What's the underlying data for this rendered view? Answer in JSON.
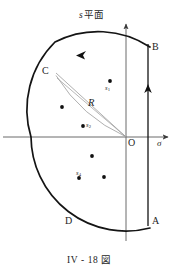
{
  "figure": {
    "caption": "IV - 18 図",
    "plane_label_symbol": "s",
    "plane_label_text": "平面",
    "axis_real_label": "σ",
    "origin_label": "O",
    "radius_label": "R",
    "contour_points": [
      {
        "name": "B",
        "label": "B",
        "x": 150,
        "y": 47
      },
      {
        "name": "C",
        "label": "C",
        "x": 48,
        "y": 72
      },
      {
        "name": "D",
        "label": "D",
        "x": 68,
        "y": 222
      },
      {
        "name": "A",
        "label": "A",
        "x": 150,
        "y": 222
      }
    ],
    "poles": [
      {
        "name": "pole-s1",
        "label": "s",
        "sub": "1",
        "x": 110,
        "y": 81,
        "label_dx": -5,
        "label_dy": 5
      },
      {
        "name": "pole-unlabeled-upper-left",
        "label": "",
        "sub": "",
        "x": 62,
        "y": 107
      },
      {
        "name": "pole-s2",
        "label": "s",
        "sub": "2",
        "x": 83,
        "y": 126,
        "label_dx": 3,
        "label_dy": -1
      },
      {
        "name": "pole-unlabeled-lower-mid",
        "label": "",
        "sub": "",
        "x": 92,
        "y": 156
      },
      {
        "name": "pole-s4",
        "label": "s",
        "sub": "4",
        "x": 79,
        "y": 178,
        "label_dx": -1,
        "label_dy": -6
      },
      {
        "name": "pole-unlabeled-lower-right",
        "label": "",
        "sub": "",
        "x": 104,
        "y": 177
      }
    ],
    "colors": {
      "ink": "#1a1a1a",
      "axis": "#555555",
      "radius_line": "#8a8a8a",
      "background": "#ffffff"
    }
  }
}
